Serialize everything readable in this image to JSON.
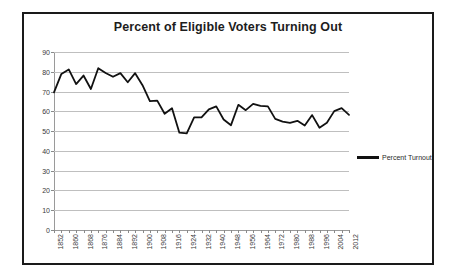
{
  "chart_data": {
    "type": "line",
    "title": "Percent of Eligible Voters Turning Out",
    "xlabel": "",
    "ylabel": "",
    "ylim": [
      0,
      90
    ],
    "ytick_step": 10,
    "yticks": [
      0,
      10,
      20,
      30,
      40,
      50,
      60,
      70,
      80,
      90
    ],
    "grid": true,
    "legend_position": "right",
    "xtick_labels": [
      "1852",
      "1860",
      "1868",
      "1876",
      "1884",
      "1892",
      "1900",
      "1908",
      "1916",
      "1924",
      "1932",
      "1940",
      "1948",
      "1956",
      "1964",
      "1972",
      "1980",
      "1988",
      "1996",
      "2004",
      "2012"
    ],
    "xtick_interval_years": 8,
    "x_interval_years": 4,
    "series": [
      {
        "name": "Percent Turnout",
        "color": "#111111",
        "x": [
          1852,
          1856,
          1860,
          1864,
          1868,
          1872,
          1876,
          1880,
          1884,
          1888,
          1892,
          1896,
          1900,
          1904,
          1908,
          1912,
          1916,
          1920,
          1924,
          1928,
          1932,
          1936,
          1940,
          1944,
          1948,
          1952,
          1956,
          1960,
          1964,
          1968,
          1972,
          1976,
          1980,
          1984,
          1988,
          1992,
          1996,
          2000,
          2004,
          2008,
          2012
        ],
        "values": [
          69.6,
          78.9,
          81.2,
          73.8,
          78.1,
          71.3,
          81.8,
          79.4,
          77.5,
          79.3,
          74.7,
          79.3,
          73.2,
          65.2,
          65.4,
          58.8,
          61.6,
          49.2,
          48.9,
          56.9,
          56.9,
          61.0,
          62.5,
          55.9,
          53.0,
          63.3,
          60.6,
          63.8,
          62.8,
          62.5,
          56.2,
          54.8,
          54.2,
          55.2,
          52.8,
          58.1,
          51.7,
          54.2,
          60.1,
          61.6,
          58.2
        ]
      }
    ]
  },
  "legend": {
    "label": "Percent Turnout"
  }
}
